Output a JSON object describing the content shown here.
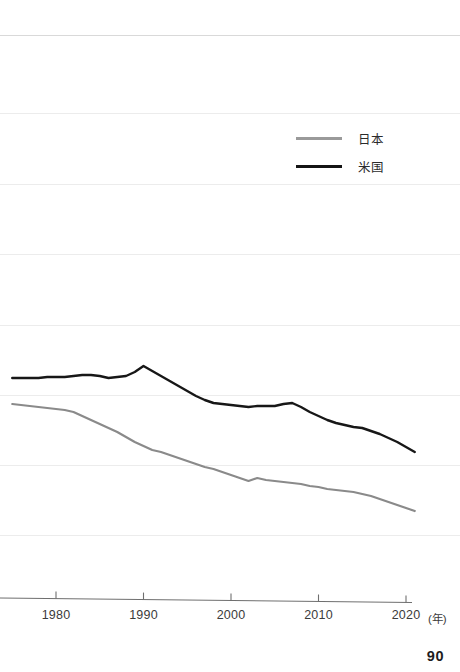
{
  "page": {
    "page_number": "90"
  },
  "axis": {
    "x_unit_label": "(年)",
    "x_tick_labels": [
      "1980",
      "1990",
      "2000",
      "2010",
      "2020"
    ]
  },
  "legend": {
    "items": [
      {
        "label": "日本",
        "color": "#9a9a9a",
        "key": "japan"
      },
      {
        "label": "米国",
        "color": "#141414",
        "key": "usa"
      }
    ]
  },
  "chart_data": {
    "type": "line",
    "title": "",
    "subtitle": "",
    "xlabel": "(年)",
    "ylabel": "",
    "grid": true,
    "legend_position": "top-right",
    "note": "Image is a crop of a larger figure: the plot area is clipped at the left edge and the y-axis with its tick labels is not visible. Y values below are expressed as pixel-row positions of the faint horizontal gridlines, which are evenly spaced (~70 px apart).",
    "x": [
      1975,
      1976,
      1977,
      1978,
      1979,
      1980,
      1981,
      1982,
      1983,
      1984,
      1985,
      1986,
      1987,
      1988,
      1989,
      1990,
      1991,
      1992,
      1993,
      1994,
      1995,
      1996,
      1997,
      1998,
      1999,
      2000,
      2001,
      2002,
      2003,
      2004,
      2005,
      2006,
      2007,
      2008,
      2009,
      2010,
      2011,
      2012,
      2013,
      2014,
      2015,
      2016,
      2017,
      2018,
      2019,
      2020,
      2021
    ],
    "xlim": [
      1975,
      2021
    ],
    "gridlines_y_px": [
      35,
      113,
      184,
      254,
      325,
      395,
      465,
      535
    ],
    "axis_y_px": 600,
    "series": [
      {
        "name": "米国",
        "key": "usa",
        "color": "#141414",
        "values_px": [
          378,
          378,
          378,
          378,
          377,
          377,
          377,
          376,
          375,
          375,
          376,
          378,
          377,
          376,
          372,
          366,
          371,
          376,
          381,
          386,
          391,
          396,
          400,
          403,
          404,
          405,
          406,
          407,
          406,
          406,
          406,
          404,
          403,
          407,
          412,
          416,
          420,
          423,
          425,
          427,
          428,
          431,
          434,
          438,
          442,
          447,
          452
        ]
      },
      {
        "name": "日本",
        "key": "japan",
        "color": "#9a9a9a",
        "values_px": [
          404,
          405,
          406,
          407,
          408,
          409,
          410,
          412,
          416,
          420,
          424,
          428,
          432,
          437,
          442,
          446,
          450,
          452,
          455,
          458,
          461,
          464,
          467,
          469,
          472,
          475,
          478,
          481,
          478,
          480,
          481,
          482,
          483,
          484,
          486,
          487,
          489,
          490,
          491,
          492,
          494,
          496,
          499,
          502,
          505,
          508,
          511
        ]
      }
    ]
  }
}
